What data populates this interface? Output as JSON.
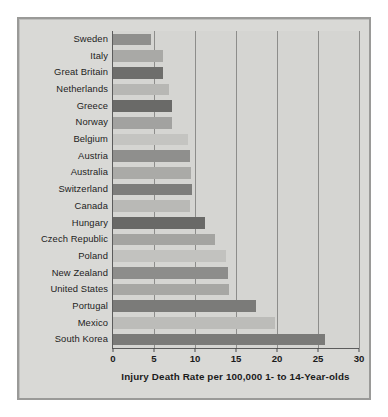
{
  "chart_data": {
    "type": "bar",
    "orientation": "horizontal",
    "title": "",
    "xlabel": "Injury Death Rate per 100,000 1- to 14-Year-olds",
    "ylabel": "",
    "xlim": [
      0,
      30
    ],
    "xticks": [
      0,
      5,
      10,
      15,
      20,
      25,
      30
    ],
    "grid": true,
    "legend": "none",
    "categories": [
      "Sweden",
      "Italy",
      "Great Britain",
      "Netherlands",
      "Greece",
      "Norway",
      "Belgium",
      "Austria",
      "Australia",
      "Switzerland",
      "Canada",
      "Hungary",
      "Czech Republic",
      "Poland",
      "New Zealand",
      "United States",
      "Portugal",
      "Mexico",
      "South Korea"
    ],
    "values": [
      4.6,
      6.1,
      6.1,
      6.8,
      7.2,
      7.2,
      9.2,
      9.4,
      9.5,
      9.6,
      9.4,
      11.2,
      12.4,
      13.8,
      14.0,
      14.2,
      17.4,
      19.8,
      25.8
    ],
    "bar_colors": [
      "#8f8f8d",
      "#a9a9a6",
      "#6e6e6c",
      "#b7b7b4",
      "#6a6a68",
      "#a2a2a0",
      "#c4c4c1",
      "#8f8f8d",
      "#aaaaa7",
      "#7d7d7b",
      "#b9b9b6",
      "#696967",
      "#a4a4a1",
      "#c2c2bf",
      "#8d8d8b",
      "#a7a7a4",
      "#7b7b79",
      "#bcbcb9",
      "#7a7a78"
    ]
  },
  "figure": {
    "background": "#d9d9d6",
    "border_color": "#9a9a98",
    "plot_background": "#d5d5d2",
    "gridline_color": "#8d8d8b",
    "axis_color": "#5c5c5c",
    "text_color": "#1b1b1b"
  }
}
